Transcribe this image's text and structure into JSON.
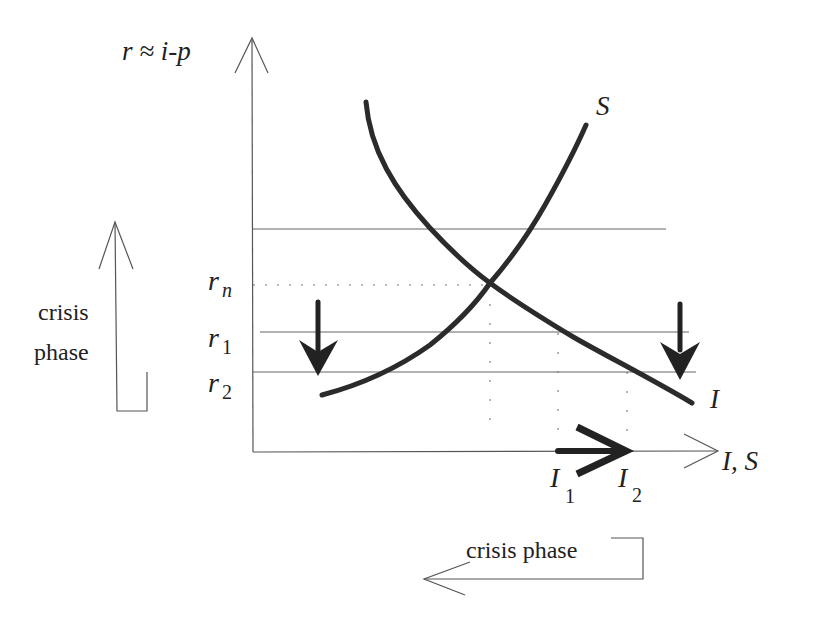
{
  "diagram": {
    "type": "economics-savings-investment",
    "y_axis_label": "r ≈ i-p",
    "x_axis_label": "I, S",
    "curves": [
      {
        "name": "I",
        "label": "I",
        "description": "Investment curve, downward sloping"
      },
      {
        "name": "S",
        "label": "S",
        "description": "Savings curve, upward sloping"
      }
    ],
    "rate_levels": [
      {
        "label": "r",
        "sub": "n",
        "style": "dotted"
      },
      {
        "label": "r",
        "sub": "1",
        "style": "solid"
      },
      {
        "label": "r",
        "sub": "2",
        "style": "solid"
      }
    ],
    "x_markers": [
      {
        "label": "I",
        "sub": "1"
      },
      {
        "label": "I",
        "sub": "2"
      }
    ],
    "side_note_vertical": {
      "line1": "crisis",
      "line2": "phase"
    },
    "side_note_horizontal": {
      "text": "crisis phase"
    },
    "colors": {
      "curve": "#2b2b2b",
      "axis": "#555555",
      "text": "#222222",
      "background": "#ffffff"
    }
  }
}
